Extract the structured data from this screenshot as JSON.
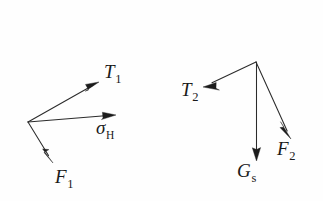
{
  "figure": {
    "background_color": "#fefefe",
    "stroke_color": "#2b2b2b",
    "width": 323,
    "height": 201,
    "left_group": {
      "name": "left-force-system",
      "origin": {
        "x": 28,
        "y": 122
      },
      "vectors": [
        {
          "id": "T1",
          "label_base": "T",
          "label_sub": "1",
          "tip": {
            "x": 99,
            "y": 82
          },
          "direction": "up-right"
        },
        {
          "id": "sigma_H",
          "label_base": "σ",
          "label_sub": "H",
          "tip": {
            "x": 116,
            "y": 115
          },
          "direction": "right"
        },
        {
          "id": "F1",
          "label_base": "F",
          "label_sub": "1",
          "tip": {
            "x": 53,
            "y": 163
          },
          "direction": "down-right"
        }
      ]
    },
    "right_group": {
      "name": "right-force-system",
      "origin": {
        "x": 256,
        "y": 62
      },
      "vectors": [
        {
          "id": "T2",
          "label_base": "T",
          "label_sub": "2",
          "tip": {
            "x": 203,
            "y": 87
          },
          "direction": "down-left"
        },
        {
          "id": "Gs",
          "label_base": "G",
          "label_sub": "s",
          "tip": {
            "x": 256,
            "y": 161
          },
          "direction": "down"
        },
        {
          "id": "F2",
          "label_base": "F",
          "label_sub": "2",
          "tip": {
            "x": 291,
            "y": 139
          },
          "direction": "down-right"
        }
      ]
    }
  }
}
